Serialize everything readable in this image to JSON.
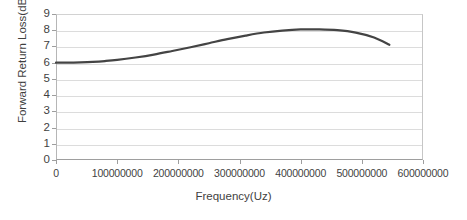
{
  "chart_data": {
    "type": "line",
    "title": "",
    "xlabel": "Frequency(Uz)",
    "ylabel": "Forward Return Loss(dB)",
    "xlim": [
      0,
      600000000
    ],
    "ylim": [
      0,
      9
    ],
    "grid": true,
    "legend": false,
    "legend_position": "none",
    "line_color": "#444444",
    "line_width": 2.2,
    "x_ticks": [
      0,
      100000000,
      200000000,
      300000000,
      400000000,
      500000000,
      600000000
    ],
    "x_tick_labels": [
      "0",
      "100000000",
      "200000000",
      "300000000",
      "400000000",
      "500000000",
      "600000000"
    ],
    "y_ticks": [
      0,
      1,
      2,
      3,
      4,
      5,
      6,
      7,
      8,
      9
    ],
    "y_tick_labels": [
      "0",
      "1",
      "2",
      "3",
      "4",
      "5",
      "6",
      "7",
      "8",
      "9"
    ],
    "series": [
      {
        "name": "Forward Return Loss",
        "x": [
          0,
          20000000,
          40000000,
          60000000,
          80000000,
          100000000,
          130000000,
          160000000,
          190000000,
          220000000,
          250000000,
          280000000,
          310000000,
          340000000,
          370000000,
          400000000,
          430000000,
          460000000,
          490000000,
          520000000,
          545000000
        ],
        "values": [
          6.0,
          6.0,
          6.02,
          6.05,
          6.1,
          6.17,
          6.32,
          6.5,
          6.72,
          6.95,
          7.2,
          7.45,
          7.67,
          7.86,
          7.98,
          8.05,
          8.05,
          8.0,
          7.85,
          7.55,
          7.1
        ]
      }
    ]
  },
  "axes": {
    "y_title": "Forward Return Loss(dB)",
    "x_title": "Frequency(Uz)"
  }
}
